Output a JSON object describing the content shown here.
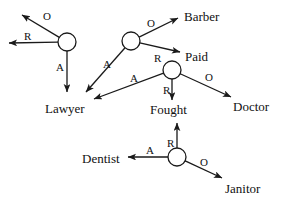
{
  "diagram": {
    "stroke_color": "#1a1a1a",
    "fill_color": "#ffffff",
    "background": "#ffffff",
    "nodes": [
      {
        "id": "node-1",
        "cx": 67,
        "cy": 42,
        "r": 9
      },
      {
        "id": "node-2",
        "cx": 131,
        "cy": 41,
        "r": 9
      },
      {
        "id": "node-3",
        "cx": 172,
        "cy": 70,
        "r": 9
      },
      {
        "id": "node-4",
        "cx": 177,
        "cy": 157,
        "r": 9
      }
    ],
    "node_labels": [
      {
        "id": "label-barber",
        "text": "Barber",
        "x": 184,
        "y": 10
      },
      {
        "id": "label-paid",
        "text": "Paid",
        "x": 185,
        "y": 50
      },
      {
        "id": "label-lawyer",
        "text": "Lawyer",
        "x": 45,
        "y": 102
      },
      {
        "id": "label-fought",
        "text": "Fought",
        "x": 150,
        "y": 103
      },
      {
        "id": "label-doctor",
        "text": "Doctor",
        "x": 233,
        "y": 100
      },
      {
        "id": "label-dentist",
        "text": "Dentist",
        "x": 82,
        "y": 152
      },
      {
        "id": "label-janitor",
        "text": "Janitor",
        "x": 225,
        "y": 182
      }
    ],
    "edges": [
      {
        "id": "edge-1-o",
        "role": "O",
        "x1": 67,
        "y1": 42,
        "x2": 22,
        "y2": 15
      },
      {
        "id": "edge-1-r",
        "role": "R",
        "x1": 67,
        "y1": 42,
        "x2": 9,
        "y2": 43
      },
      {
        "id": "edge-1-a",
        "role": "A",
        "x1": 67,
        "y1": 42,
        "x2": 67,
        "y2": 92
      },
      {
        "id": "edge-2-o",
        "role": "O",
        "x1": 131,
        "y1": 41,
        "x2": 178,
        "y2": 18
      },
      {
        "id": "edge-2-r",
        "role": "R",
        "x1": 131,
        "y1": 41,
        "x2": 180,
        "y2": 52
      },
      {
        "id": "edge-2-a",
        "role": "A",
        "x1": 131,
        "y1": 41,
        "x2": 86,
        "y2": 92
      },
      {
        "id": "edge-3-a",
        "role": "A",
        "x1": 172,
        "y1": 70,
        "x2": 94,
        "y2": 99
      },
      {
        "id": "edge-3-r",
        "role": "R",
        "x1": 172,
        "y1": 70,
        "x2": 172,
        "y2": 100
      },
      {
        "id": "edge-3-o",
        "role": "O",
        "x1": 172,
        "y1": 70,
        "x2": 231,
        "y2": 97
      },
      {
        "id": "edge-4-r",
        "role": "R",
        "x1": 177,
        "y1": 157,
        "x2": 177,
        "y2": 123
      },
      {
        "id": "edge-4-a",
        "role": "A",
        "x1": 177,
        "y1": 157,
        "x2": 128,
        "y2": 157
      },
      {
        "id": "edge-4-o",
        "role": "O",
        "x1": 177,
        "y1": 157,
        "x2": 222,
        "y2": 178
      }
    ],
    "edge_labels": [
      {
        "id": "edge-label-1-o",
        "text": "O",
        "x": 43,
        "y": 11
      },
      {
        "id": "edge-label-1-r",
        "text": "R",
        "x": 24,
        "y": 31
      },
      {
        "id": "edge-label-1-a",
        "text": "A",
        "x": 56,
        "y": 62
      },
      {
        "id": "edge-label-2-o",
        "text": "O",
        "x": 147,
        "y": 18
      },
      {
        "id": "edge-label-2-r",
        "text": "R",
        "x": 154,
        "y": 53
      },
      {
        "id": "edge-label-2-a",
        "text": "A",
        "x": 103,
        "y": 59
      },
      {
        "id": "edge-label-3-a",
        "text": "A",
        "x": 130,
        "y": 73
      },
      {
        "id": "edge-label-3-r",
        "text": "R",
        "x": 163,
        "y": 85
      },
      {
        "id": "edge-label-3-o",
        "text": "O",
        "x": 205,
        "y": 72
      },
      {
        "id": "edge-label-4-r",
        "text": "R",
        "x": 167,
        "y": 138
      },
      {
        "id": "edge-label-4-a",
        "text": "A",
        "x": 146,
        "y": 145
      },
      {
        "id": "edge-label-4-o",
        "text": "O",
        "x": 200,
        "y": 157
      }
    ]
  }
}
